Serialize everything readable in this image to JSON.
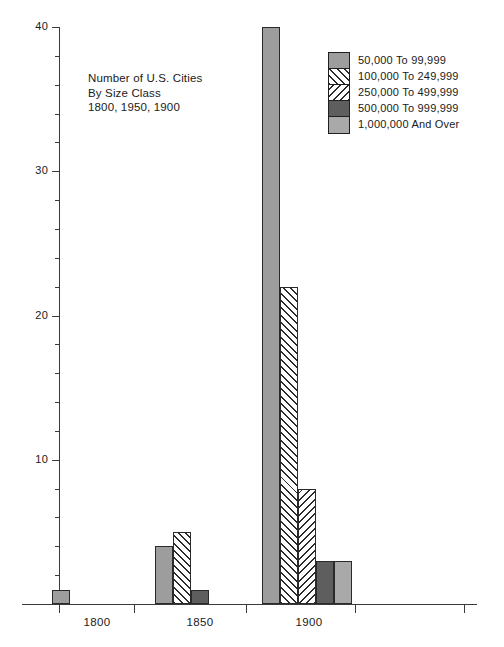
{
  "chart_data": {
    "type": "bar",
    "title": "Number of U.S. Cities By Size Class 1800, 1950, 1900",
    "title_lines": [
      "Number of U.S. Cities",
      "By Size Class",
      "1800, 1950, 1900"
    ],
    "xlabel": "",
    "ylabel": "",
    "ylim": [
      0,
      40
    ],
    "yticks_major": [
      0,
      10,
      20,
      30,
      40
    ],
    "yticks_major_labels": [
      "",
      "10",
      "20",
      "30",
      "40"
    ],
    "yticks_minor_step": 2,
    "grid": false,
    "legend_position": "top-right",
    "categories": [
      "1800",
      "1850",
      "1900"
    ],
    "series": [
      {
        "name": "50,000 To 99,999",
        "pattern": "solid-mid",
        "color": "#9d9d9d",
        "values": [
          1,
          4,
          40
        ]
      },
      {
        "name": "100,000 To 249,999",
        "pattern": "hatch-fwd",
        "color": "#ffffff",
        "values": [
          0,
          5,
          22
        ]
      },
      {
        "name": "250,000 To 499,999",
        "pattern": "hatch-back",
        "color": "#ffffff",
        "values": [
          0,
          0,
          8
        ]
      },
      {
        "name": "500,000 To 999,999",
        "pattern": "dark",
        "color": "#5e5e5e",
        "values": [
          0,
          1,
          3
        ]
      },
      {
        "name": "1,000,000 And Over",
        "pattern": "light",
        "color": "#a9a9a9",
        "values": [
          0,
          0,
          3
        ]
      }
    ]
  },
  "axes": {
    "y_labels": [
      {
        "value": 40,
        "text": "40"
      },
      {
        "value": 30,
        "text": "30"
      },
      {
        "value": 20,
        "text": "20"
      },
      {
        "value": 10,
        "text": "10"
      }
    ],
    "x_labels": [
      {
        "text": "1800"
      },
      {
        "text": "1850"
      },
      {
        "text": "1900"
      }
    ]
  },
  "legend": {
    "items": [
      {
        "label": "50,000 To 99,999",
        "pattern": "solid-mid"
      },
      {
        "label": "100,000 To 249,999",
        "pattern": "hatch-fwd"
      },
      {
        "label": "250,000 To 499,999",
        "pattern": "hatch-back"
      },
      {
        "label": "500,000 To 999,999",
        "pattern": "dark"
      },
      {
        "label": "1,000,000 And Over",
        "pattern": "light"
      }
    ]
  }
}
